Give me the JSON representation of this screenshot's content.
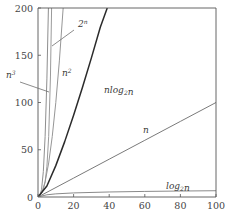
{
  "chart_data": {
    "type": "line",
    "title": "",
    "xlabel": "",
    "ylabel": "",
    "xlim": [
      0,
      100
    ],
    "ylim": [
      0,
      200
    ],
    "grid": false,
    "legend": "inline-curve-labels",
    "xticks": [
      "0",
      "20",
      "40",
      "60",
      "80",
      "100"
    ],
    "xtick_values": [
      0,
      20,
      40,
      60,
      80,
      100
    ],
    "yticks": [
      "0",
      "50",
      "100",
      "150",
      "200"
    ],
    "ytick_values": [
      0,
      50,
      100,
      150,
      200
    ],
    "series": [
      {
        "name": "2^n",
        "label_text": "2",
        "label_sup": "n",
        "label_sub": "",
        "color": "#9a9a9a",
        "values": [
          [
            0,
            1
          ],
          [
            1,
            2
          ],
          [
            2,
            4
          ],
          [
            3,
            8
          ],
          [
            4,
            16
          ],
          [
            5,
            32
          ],
          [
            6,
            64
          ],
          [
            7,
            128
          ],
          [
            7.64,
            200
          ]
        ]
      },
      {
        "name": "n^3",
        "label_text": "n",
        "label_sup": "3",
        "label_sub": "",
        "color": "#8e8e8e",
        "values": [
          [
            0,
            0
          ],
          [
            1,
            1
          ],
          [
            2,
            8
          ],
          [
            3,
            27
          ],
          [
            4,
            64
          ],
          [
            5,
            125
          ],
          [
            5.85,
            200
          ]
        ]
      },
      {
        "name": "n^2",
        "label_text": "n",
        "label_sup": "2",
        "label_sub": "",
        "color": "#969696",
        "values": [
          [
            0,
            0
          ],
          [
            2,
            4
          ],
          [
            4,
            16
          ],
          [
            6,
            36
          ],
          [
            8,
            64
          ],
          [
            10,
            100
          ],
          [
            12,
            144
          ],
          [
            14.14,
            200
          ]
        ]
      },
      {
        "name": "n log2 n",
        "label_text": "nlog",
        "label_sup": "",
        "label_sub": "2",
        "label_tail": "n",
        "color": "#2b2b2b",
        "values": [
          [
            0,
            0
          ],
          [
            5,
            11.6
          ],
          [
            10,
            33.2
          ],
          [
            15,
            58.6
          ],
          [
            20,
            86.4
          ],
          [
            25,
            116.1
          ],
          [
            30,
            147.2
          ],
          [
            35,
            179.6
          ],
          [
            38.9,
            200
          ]
        ]
      },
      {
        "name": "n",
        "label_text": "n",
        "label_sup": "",
        "label_sub": "",
        "color": "#7a7a7a",
        "values": [
          [
            0,
            0
          ],
          [
            20,
            20
          ],
          [
            40,
            40
          ],
          [
            60,
            60
          ],
          [
            80,
            80
          ],
          [
            100,
            100
          ]
        ]
      },
      {
        "name": "log2 n",
        "label_text": "log",
        "label_sup": "",
        "label_sub": "2",
        "label_tail": "n",
        "color": "#8a8a8a",
        "values": [
          [
            0,
            0
          ],
          [
            1,
            0
          ],
          [
            2,
            1
          ],
          [
            5,
            2.32
          ],
          [
            10,
            3.32
          ],
          [
            20,
            4.32
          ],
          [
            40,
            5.32
          ],
          [
            60,
            5.91
          ],
          [
            80,
            6.32
          ],
          [
            100,
            6.64
          ]
        ]
      }
    ],
    "annotations": [
      {
        "name": "label-2-to-the-n",
        "text": "2ⁿ",
        "x": 78,
        "y": 27,
        "leader": [
          [
            74,
            30
          ],
          [
            52,
            46
          ]
        ]
      },
      {
        "name": "label-n-cubed",
        "text": "n³",
        "x": 6,
        "y": 78,
        "leader": [
          [
            20,
            82
          ],
          [
            49,
            92
          ]
        ]
      },
      {
        "name": "label-n-squared",
        "text": "n²",
        "x": 62,
        "y": 76,
        "leader": []
      },
      {
        "name": "label-n-log-n",
        "text": "nlog₂n",
        "x": 104,
        "y": 93,
        "leader": []
      },
      {
        "name": "label-n",
        "text": "n",
        "x": 143,
        "y": 133,
        "leader": []
      },
      {
        "name": "label-log-n",
        "text": "log₂n",
        "x": 166,
        "y": 189,
        "leader": []
      }
    ]
  },
  "axes": {
    "x_left_px": 38,
    "x_right_px": 216,
    "y_top_px": 8,
    "y_bottom_px": 197,
    "frame_color": "#555555"
  }
}
